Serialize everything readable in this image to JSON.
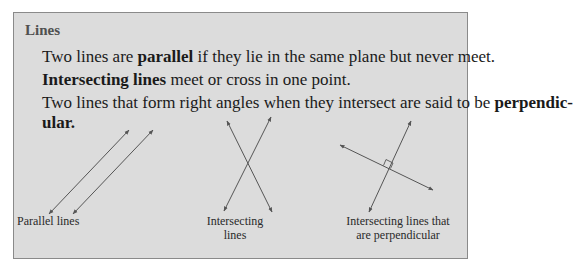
{
  "box": {
    "title": "Lines",
    "paragraphs": [
      {
        "pre": "Two lines are ",
        "bold": "parallel",
        "post": " if they lie in the same plane but never meet."
      },
      {
        "pre": "",
        "bold": "Intersecting lines",
        "post": " meet or cross in one point."
      },
      {
        "pre": "Two lines that form right angles when they intersect are said to be ",
        "bold": "perpendic-",
        "post": ""
      },
      {
        "pre": "",
        "bold": "ular.",
        "post": ""
      }
    ],
    "figures": [
      {
        "caption_line1": "Parallel lines",
        "caption_line2": ""
      },
      {
        "caption_line1": "Intersecting",
        "caption_line2": "lines"
      },
      {
        "caption_line1": "Intersecting lines that",
        "caption_line2": "are perpendicular"
      }
    ],
    "colors": {
      "background": "#dcdcdc",
      "border": "#8a8a8a",
      "line": "#555555"
    }
  }
}
